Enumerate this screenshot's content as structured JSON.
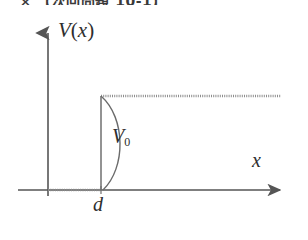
{
  "header": {
    "mark": "×",
    "text": "【次回問題 10-1】"
  },
  "figure": {
    "labels": {
      "y_axis": "V",
      "y_axis_arg_open": "(",
      "y_axis_arg": "x",
      "y_axis_arg_close": ")",
      "y_axis_full": "V(x)",
      "barrier_height": "V",
      "barrier_height_sub": "0",
      "barrier_height_full": "V0",
      "x_position": "d",
      "x_axis": "x"
    },
    "colors": {
      "ink": "#2e2e2e",
      "axis": "#555555",
      "curve": "#6b6b6b",
      "plateau": "#8a8a8a",
      "background": "#ffffff"
    },
    "geometry": {
      "y_axis_x": 48,
      "y_axis_top": 30,
      "y_axis_bottom": 196,
      "x_axis_y": 190,
      "x_axis_left": 18,
      "x_axis_right": 286,
      "step_x": 101,
      "step_top_y": 96,
      "plateau_right": 281,
      "curve_bulge_x": 124
    }
  }
}
